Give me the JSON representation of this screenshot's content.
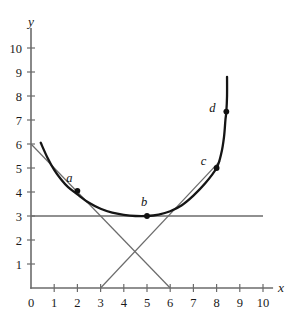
{
  "chart_data": {
    "type": "line",
    "title": "",
    "xlabel": "x",
    "ylabel": "y",
    "xlim": [
      0,
      10.4
    ],
    "ylim": [
      0,
      10.8
    ],
    "grid": false,
    "legend": null,
    "x_ticks": [
      "0",
      "1",
      "2",
      "3",
      "4",
      "5",
      "6",
      "7",
      "8",
      "9",
      "10"
    ],
    "x_tick_values": [
      0,
      1,
      2,
      3,
      4,
      5,
      6,
      7,
      8,
      9,
      10
    ],
    "y_ticks": [
      "1",
      "2",
      "3",
      "4",
      "5",
      "6",
      "7",
      "8",
      "9",
      "10"
    ],
    "y_tick_values": [
      1,
      2,
      3,
      4,
      5,
      6,
      7,
      8,
      9,
      10
    ],
    "series": [
      {
        "name": "curve",
        "style": "thick-black-curve",
        "color": "#151515",
        "points": [
          [
            0.42,
            6.05
          ],
          [
            0.7,
            5.45
          ],
          [
            1.0,
            4.92
          ],
          [
            1.3,
            4.52
          ],
          [
            1.6,
            4.2
          ],
          [
            2.0,
            3.9
          ],
          [
            2.5,
            3.55
          ],
          [
            3.0,
            3.3
          ],
          [
            3.5,
            3.14
          ],
          [
            4.0,
            3.05
          ],
          [
            4.5,
            3.0
          ],
          [
            5.0,
            3.0
          ],
          [
            5.5,
            3.06
          ],
          [
            6.0,
            3.2
          ],
          [
            6.5,
            3.45
          ],
          [
            7.0,
            3.85
          ],
          [
            7.5,
            4.35
          ],
          [
            8.0,
            5.0
          ],
          [
            8.2,
            5.6
          ],
          [
            8.32,
            6.3
          ],
          [
            8.38,
            7.0
          ],
          [
            8.42,
            7.35
          ],
          [
            8.45,
            8.0
          ],
          [
            8.45,
            8.8
          ]
        ]
      }
    ],
    "annotations": [
      {
        "name": "horizontal-line-y3",
        "type": "horizontal-line",
        "y": 3,
        "x_from": 0,
        "x_to": 10,
        "color": "#6b6b6b"
      },
      {
        "name": "tangent-at-a",
        "type": "line",
        "from": [
          0,
          6
        ],
        "to": [
          6,
          0
        ],
        "color": "#6b6b6b"
      },
      {
        "name": "tangent-at-c",
        "type": "line",
        "from": [
          3,
          0
        ],
        "to": [
          8.15,
          5.3
        ],
        "color": "#6b6b6b"
      }
    ],
    "labeled_points": [
      {
        "label": "a",
        "x": 2.0,
        "y": 4.05,
        "label_dx": -8,
        "label_dy": -9
      },
      {
        "label": "b",
        "x": 5.0,
        "y": 3.0,
        "label_dx": -3,
        "label_dy": -10
      },
      {
        "label": "c",
        "x": 8.0,
        "y": 5.0,
        "label_dx": -13,
        "label_dy": -3
      },
      {
        "label": "d",
        "x": 8.42,
        "y": 7.35,
        "label_dx": -14,
        "label_dy": 0
      }
    ]
  },
  "axes": {
    "x_axis_label": "x",
    "y_axis_label": "y"
  }
}
